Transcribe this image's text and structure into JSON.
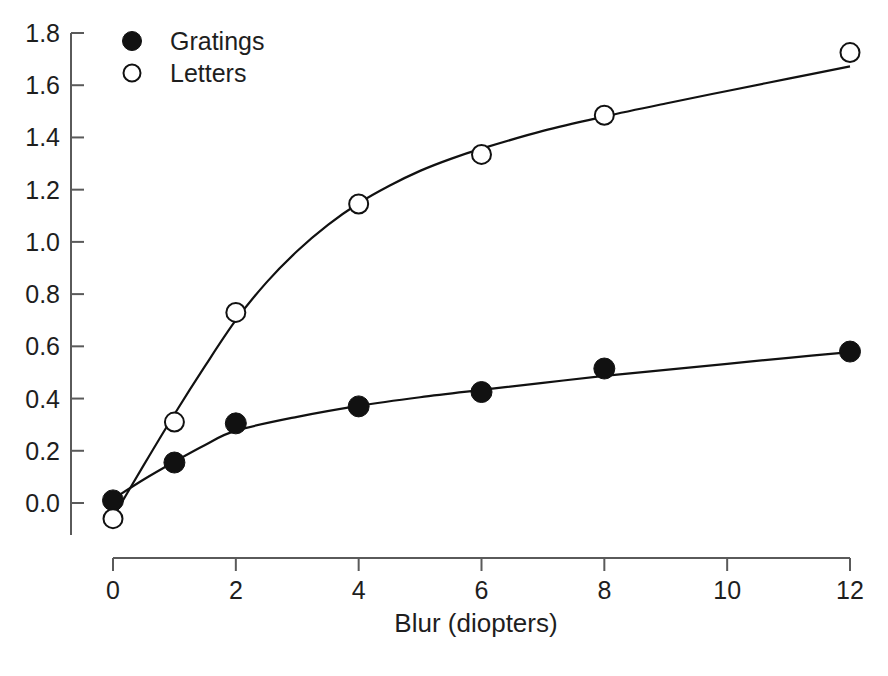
{
  "chart_data": {
    "type": "scatter",
    "title": "",
    "subtitle": "",
    "xlabel": "Blur (diopters)",
    "ylabel": "",
    "xlim": [
      0,
      12
    ],
    "ylim": [
      0.0,
      1.8
    ],
    "grid": false,
    "legend_position": "top-left",
    "x_ticks": [
      "0",
      "2",
      "4",
      "6",
      "8",
      "10",
      "12"
    ],
    "x_tick_values": [
      0,
      2,
      4,
      6,
      8,
      10,
      12
    ],
    "y_ticks": [
      "0.0",
      "0.2",
      "0.4",
      "0.6",
      "0.8",
      "1.0",
      "1.2",
      "1.4",
      "1.6",
      "1.8"
    ],
    "y_tick_values": [
      0.0,
      0.2,
      0.4,
      0.6,
      0.8,
      1.0,
      1.2,
      1.4,
      1.6,
      1.8
    ],
    "x": [
      0,
      1,
      2,
      4,
      6,
      8,
      12
    ],
    "series": [
      {
        "name": "Gratings",
        "marker": "filled-circle",
        "color": "#111111",
        "values": [
          0.01,
          0.155,
          0.305,
          0.37,
          0.425,
          0.515,
          0.58
        ],
        "fit_curve": [
          [
            0,
            0.015
          ],
          [
            0.5,
            0.09
          ],
          [
            1,
            0.158
          ],
          [
            1.5,
            0.222
          ],
          [
            2,
            0.277
          ],
          [
            3,
            0.33
          ],
          [
            4,
            0.372
          ],
          [
            5,
            0.405
          ],
          [
            6,
            0.433
          ],
          [
            7,
            0.46
          ],
          [
            8,
            0.487
          ],
          [
            9,
            0.51
          ],
          [
            10,
            0.533
          ],
          [
            11,
            0.556
          ],
          [
            12,
            0.578
          ]
        ]
      },
      {
        "name": "Letters",
        "marker": "open-circle",
        "color": "#111111",
        "values": [
          -0.06,
          0.31,
          0.73,
          1.145,
          1.335,
          1.485,
          1.725
        ],
        "fit_curve": [
          [
            0,
            -0.055
          ],
          [
            0.5,
            0.145
          ],
          [
            1,
            0.34
          ],
          [
            1.5,
            0.525
          ],
          [
            2,
            0.7
          ],
          [
            2.5,
            0.845
          ],
          [
            3,
            0.965
          ],
          [
            3.5,
            1.065
          ],
          [
            4,
            1.148
          ],
          [
            4.5,
            1.215
          ],
          [
            5,
            1.272
          ],
          [
            5.5,
            1.318
          ],
          [
            6,
            1.357
          ],
          [
            7,
            1.425
          ],
          [
            8,
            1.48
          ],
          [
            9,
            1.53
          ],
          [
            10,
            1.578
          ],
          [
            11,
            1.625
          ],
          [
            12,
            1.672
          ]
        ]
      }
    ]
  },
  "legend": {
    "entries": [
      {
        "label": "Gratings",
        "marker": "filled-circle"
      },
      {
        "label": "Letters",
        "marker": "open-circle"
      }
    ]
  },
  "axes": {
    "x_title": "Blur (diopters)",
    "axis_color": "#5a5a5a"
  }
}
